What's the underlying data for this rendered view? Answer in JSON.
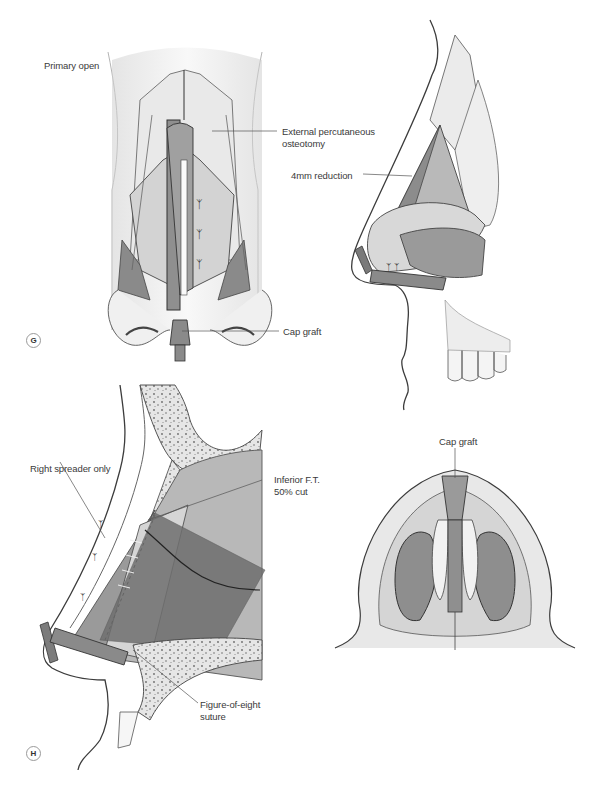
{
  "figure": {
    "panels": [
      {
        "id": "G",
        "marker": "G",
        "view": "frontal",
        "labels": {
          "title": "Primary open",
          "osteotomy": "External percutaneous\nosteotomy",
          "cap_graft": "Cap graft"
        }
      },
      {
        "id": "G-lateral",
        "view": "lateral",
        "labels": {
          "reduction": "4mm reduction"
        }
      },
      {
        "id": "H",
        "marker": "H",
        "view": "sagittal",
        "labels": {
          "spreader": "Right spreader only",
          "inferior_ft": "Inferior F.T.\n50% cut",
          "suture": "Figure-of-eight\nsuture"
        }
      },
      {
        "id": "H-basal",
        "view": "basal",
        "labels": {
          "cap_graft": "Cap graft"
        }
      }
    ],
    "colors": {
      "background": "#ffffff",
      "outline": "#3c3c3c",
      "skin_light": "#ececec",
      "tissue_mid": "#bdbdbd",
      "tissue_dark": "#8e8e8e",
      "graft": "#7f7f7f",
      "leader_line": "#555555"
    }
  }
}
